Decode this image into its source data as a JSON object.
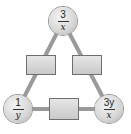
{
  "diagram": {
    "type": "arithmagon",
    "colors": {
      "edge": "#9a9a9a",
      "node_fill": "#d6d6d6",
      "box_fill": "#d4d4d4",
      "box_border": "#6f6f6f"
    },
    "nodes": {
      "top": {
        "numerator": "3",
        "denominator": "x"
      },
      "bottom_left": {
        "numerator": "1",
        "denominator": "y"
      },
      "bottom_right": {
        "numerator": "3y",
        "denominator": "x"
      }
    },
    "boxes": {
      "left": "",
      "right": "",
      "bottom": ""
    }
  }
}
